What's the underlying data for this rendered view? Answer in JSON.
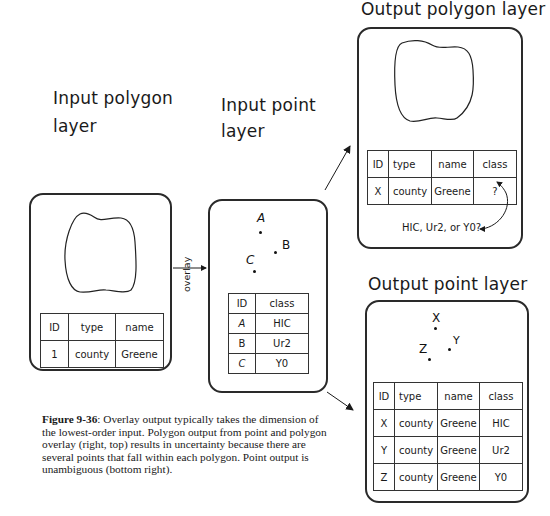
{
  "panels": {
    "input_polygon": {
      "title_line1": "Input polygon",
      "title_line2": "layer",
      "table": {
        "headers": [
          "ID",
          "type",
          "name"
        ],
        "rows": [
          [
            "1",
            "county",
            "Greene"
          ]
        ]
      }
    },
    "input_point": {
      "title_line1": "Input point",
      "title_line2": "layer",
      "points": [
        {
          "label": "A"
        },
        {
          "label": "B"
        },
        {
          "label": "C"
        }
      ],
      "table": {
        "headers": [
          "ID",
          "class"
        ],
        "rows": [
          [
            "A",
            "HIC"
          ],
          [
            "B",
            "Ur2"
          ],
          [
            "C",
            "Y0"
          ]
        ]
      }
    },
    "output_polygon": {
      "title": "Output polygon layer",
      "table": {
        "headers": [
          "ID",
          "type",
          "name",
          "class"
        ],
        "rows": [
          [
            "X",
            "county",
            "Greene",
            "?"
          ]
        ]
      },
      "note": "HIC, Ur2, or Y0?"
    },
    "output_point": {
      "title": "Output point layer",
      "points": [
        {
          "label": "X"
        },
        {
          "label": "Y"
        },
        {
          "label": "Z"
        }
      ],
      "table": {
        "headers": [
          "ID",
          "type",
          "name",
          "class"
        ],
        "rows": [
          [
            "X",
            "county",
            "Greene",
            "HIC"
          ],
          [
            "Y",
            "county",
            "Greene",
            "Ur2"
          ],
          [
            "Z",
            "county",
            "Greene",
            "Y0"
          ]
        ]
      }
    }
  },
  "arrows": {
    "overlay_label": "overlay"
  },
  "caption": {
    "label": "Figure 9-36",
    "text": ": Overlay output typically takes the dimension of the lowest-order input. Polygon output from point and polygon overlay (right, top) results in uncertainty because there are several points that fall within each polygon. Point output is unambiguous (bottom right)."
  }
}
